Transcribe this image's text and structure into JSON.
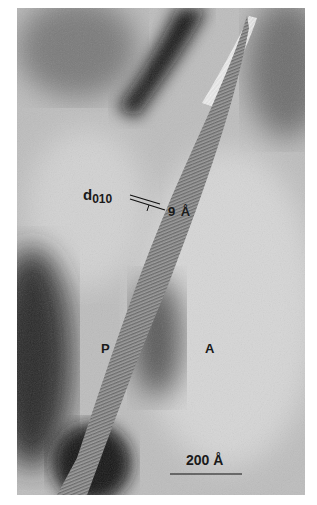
{
  "figure": {
    "type": "transmission electron micrograph (lattice fringes)",
    "labels": {
      "spacing_symbol": "d",
      "spacing_index": "010",
      "spacing_value": "9 Å",
      "phase_left": "P",
      "phase_right": "A",
      "scale_bar": "200 Å"
    },
    "colors": {
      "background": "#ffffff",
      "light_region": "#c9c9c9",
      "dark_region": "#1c1c1c",
      "text": "#1a1a1a"
    }
  }
}
